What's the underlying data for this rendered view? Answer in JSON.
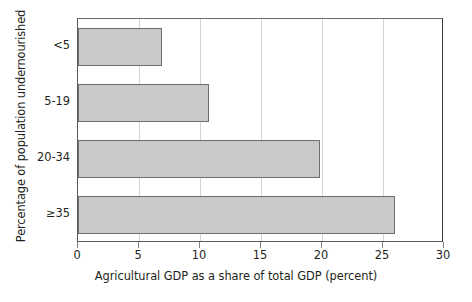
{
  "chart_data": {
    "type": "bar",
    "orientation": "horizontal",
    "title": "",
    "xlabel": "Agricultural GDP as a share of total GDP (percent)",
    "ylabel": "Percentage of population undernourished",
    "categories": [
      "<5",
      "5-19",
      "20-34",
      "≥35"
    ],
    "values": [
      6.9,
      10.7,
      19.8,
      26.0
    ],
    "xlim": [
      0,
      30
    ],
    "xticks": [
      0,
      5,
      10,
      15,
      20,
      25,
      30
    ],
    "xticklabels": [
      "0",
      "5",
      "10",
      "15",
      "20",
      "25",
      "30"
    ],
    "grid": "vertical",
    "legend": "none",
    "bar_fill_color": "#c9c9c9",
    "bar_edge_color": "#6d6e70",
    "axis_color": "#58595b",
    "gridline_color": "#d2d3d4",
    "text_color": "#231f20",
    "background_color": "#ffffff"
  }
}
